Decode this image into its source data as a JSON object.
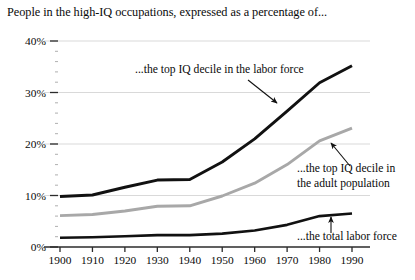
{
  "chart_data": {
    "type": "line",
    "title": "People in the high-IQ occupations, expressed as a percentage of...",
    "xlabel": "",
    "ylabel": "",
    "x": [
      1900,
      1910,
      1920,
      1930,
      1940,
      1950,
      1960,
      1970,
      1980,
      1990
    ],
    "xlim": [
      1900,
      1990
    ],
    "ylim": [
      0,
      40
    ],
    "ytick_labels": [
      "0%",
      "10%",
      "20%",
      "30%",
      "40%"
    ],
    "ytick_values": [
      0,
      10,
      20,
      30,
      40
    ],
    "xtick_labels": [
      "1900",
      "1910",
      "1920",
      "1930",
      "1940",
      "1950",
      "1960",
      "1970",
      "1980",
      "1990"
    ],
    "minor_ticks_per_interval": 4,
    "grid": "horizontal",
    "legend_position": "inline-annotations",
    "series": [
      {
        "name": "...the top IQ decile in the labor force",
        "color": "#111111",
        "width": 2.9,
        "values": [
          9.8,
          10.1,
          11.6,
          13.0,
          13.1,
          16.5,
          21.0,
          26.4,
          31.9,
          35.2
        ]
      },
      {
        "name": "...the top IQ decile in the adult population",
        "color": "#a8a8a8",
        "width": 2.9,
        "values": [
          6.1,
          6.3,
          7.0,
          7.9,
          8.0,
          9.9,
          12.4,
          16.0,
          20.6,
          23.1
        ]
      },
      {
        "name": "...the total labor force",
        "color": "#111111",
        "width": 2.6,
        "values": [
          1.8,
          1.9,
          2.1,
          2.3,
          2.3,
          2.6,
          3.2,
          4.3,
          6.0,
          6.5
        ]
      }
    ],
    "annotations": [
      {
        "id": "annotation-labor-force",
        "text": "...the top IQ decile in the labor force",
        "lines": [
          "...the top IQ decile in the labor force"
        ],
        "x": 135,
        "y": 73,
        "arrow": {
          "x1": 248,
          "y1": 80,
          "x2": 277,
          "y2": 103
        }
      },
      {
        "id": "annotation-adult-population",
        "text": "...the top IQ decile in the adult population",
        "lines": [
          "...the top IQ decile in",
          "the adult population"
        ],
        "x": 297,
        "y": 172,
        "arrow": {
          "x1": 350,
          "y1": 166,
          "x2": 331,
          "y2": 143
        }
      },
      {
        "id": "annotation-total-labor-force",
        "text": "...the total labor force",
        "lines": [
          "...the total labor force"
        ],
        "x": 297,
        "y": 240,
        "arrow": {
          "x1": 331,
          "y1": 233,
          "x2": 331,
          "y2": 217
        }
      }
    ]
  }
}
